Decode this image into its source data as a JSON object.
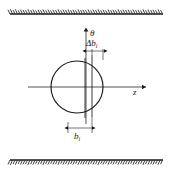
{
  "figure": {
    "background_color": "#ffffff",
    "ink_color": "#1a1a1a",
    "width": 172,
    "height": 175
  },
  "axes": {
    "vertical": {
      "label": "θ",
      "label_name": "theta-axis-label",
      "x": 86,
      "y_top": 30,
      "y_bottom": 124,
      "arrow": "up"
    },
    "horizontal": {
      "label": "z",
      "label_name": "z-axis-label",
      "y": 87,
      "x_left": 28,
      "x_right": 146,
      "arrow": "right"
    },
    "origin": {
      "x": 86,
      "y": 87
    }
  },
  "circle": {
    "name": "cross-section-circle",
    "center_x": 77,
    "center_y": 87,
    "radius": 26
  },
  "strip": {
    "name": "element-strip",
    "left_x": 85,
    "right_x": 92,
    "top_y": 58,
    "bottom_y": 118
  },
  "dimensions": [
    {
      "name": "delta-b-i-dimension",
      "label": "Δb",
      "subscript": "i",
      "label_x": 87,
      "label_y": 45,
      "line_y": 51,
      "x_start": 85,
      "x_end": 103,
      "description": "Width of the differential strip element"
    },
    {
      "name": "b-i-dimension",
      "label": "b",
      "subscript": "i",
      "label_x": 80,
      "label_y": 136,
      "line_y": 128,
      "x_start": 68,
      "x_end": 92,
      "description": "Offset distance of the strip from the theta axis"
    }
  ],
  "boundaries": [
    {
      "name": "upper-boundary-wall",
      "position": "top",
      "line_y": 14,
      "x_start": 10,
      "x_end": 163,
      "hatch_side": "above",
      "hatch_count": 62
    },
    {
      "name": "lower-boundary-wall",
      "position": "bottom",
      "line_y": 160,
      "x_start": 10,
      "x_end": 163,
      "hatch_side": "below",
      "hatch_count": 62
    }
  ]
}
